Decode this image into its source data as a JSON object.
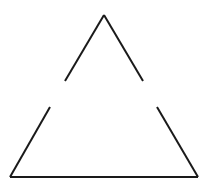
{
  "figure": {
    "shape": "triangle-with-gaps",
    "stroke_color": "#1a1a1a",
    "background": "#ffffff",
    "stroke_width": 2,
    "segments": [
      {
        "name": "upper-left-edge",
        "x1": 104,
        "y1": 15,
        "x2": 65,
        "y2": 81
      },
      {
        "name": "upper-right-edge",
        "x1": 104,
        "y1": 15,
        "x2": 143,
        "y2": 81
      },
      {
        "name": "lower-left-edge",
        "x1": 50,
        "y1": 107,
        "x2": 10,
        "y2": 177
      },
      {
        "name": "lower-right-edge",
        "x1": 157,
        "y1": 107,
        "x2": 198,
        "y2": 177
      },
      {
        "name": "base-edge",
        "x1": 10,
        "y1": 177,
        "x2": 198,
        "y2": 177
      }
    ]
  }
}
